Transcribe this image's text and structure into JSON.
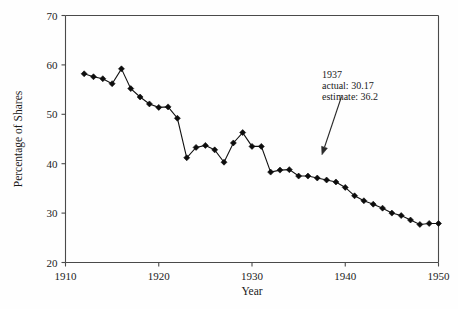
{
  "chart_data": {
    "type": "line",
    "title": "",
    "xlabel": "Year",
    "ylabel": "Percentage of Shares",
    "xlim": [
      1910,
      1950
    ],
    "ylim": [
      20,
      70
    ],
    "xticks": [
      1910,
      1920,
      1930,
      1940,
      1950
    ],
    "xtick_labels": [
      "1910",
      "1920",
      "1930",
      "1940",
      "1950"
    ],
    "yticks": [
      20,
      30,
      40,
      50,
      60,
      70
    ],
    "ytick_labels": [
      "20",
      "30",
      "40",
      "50",
      "60",
      "70"
    ],
    "grid": false,
    "legend": null,
    "marker": "filled-diamond",
    "line_color": "#111111",
    "marker_color": "#0d0d0d",
    "x": [
      1912,
      1913,
      1914,
      1915,
      1916,
      1917,
      1918,
      1919,
      1920,
      1921,
      1922,
      1923,
      1924,
      1925,
      1926,
      1927,
      1928,
      1929,
      1930,
      1931,
      1932,
      1933,
      1934,
      1935,
      1936,
      1937,
      1938,
      1939,
      1940,
      1941,
      1942,
      1943,
      1944,
      1945,
      1946,
      1947,
      1948,
      1949,
      1950
    ],
    "values": [
      58.2,
      57.6,
      57.2,
      56.2,
      59.2,
      55.2,
      53.5,
      52.1,
      51.4,
      51.5,
      49.2,
      41.2,
      43.3,
      43.7,
      42.8,
      40.3,
      44.2,
      46.3,
      43.5,
      43.5,
      38.3,
      38.7,
      38.8,
      37.5,
      37.5,
      37.1,
      36.7,
      36.3,
      35.2,
      33.5,
      32.5,
      31.8,
      31.0,
      30.0,
      29.5,
      28.6,
      27.7,
      27.9,
      27.9
    ],
    "annotations": [
      {
        "name": "1937-callout",
        "lines": [
          "1937",
          "actual: 30.17",
          "estimate: 36.2"
        ],
        "text_x": 1938.5,
        "text_y": 55.5,
        "arrow_from": [
          1939.6,
          53.6
        ],
        "arrow_to": [
          1937.5,
          41.8
        ]
      }
    ]
  },
  "annotation": {
    "line1": "1937",
    "line2": "actual: 30.17",
    "line3": "estimate: 36.2"
  },
  "axes": {
    "xlabel": "Year",
    "ylabel": "Percentage of Shares"
  },
  "colors": {
    "series": "#111111",
    "axis": "#4a4a4a",
    "text": "#1a1a1a",
    "background": "#fefefe"
  }
}
